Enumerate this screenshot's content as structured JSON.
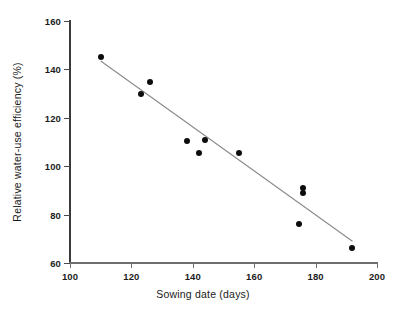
{
  "chart_data": {
    "type": "scatter",
    "title": "",
    "subtitle": "",
    "xlabel": "Sowing date (days)",
    "ylabel": "Relative water-use efficiency (%)",
    "xlim": [
      100,
      200
    ],
    "ylim": [
      60,
      160
    ],
    "xticks": [
      100,
      120,
      140,
      160,
      180,
      200
    ],
    "yticks": [
      60,
      80,
      100,
      120,
      140,
      160
    ],
    "xtick_labels": [
      "100",
      "120",
      "140",
      "160",
      "180",
      "200"
    ],
    "ytick_labels": [
      "60",
      "80",
      "100",
      "120",
      "140",
      "160"
    ],
    "grid": false,
    "legend": null,
    "legend_position": "none",
    "marker": "filled-circle",
    "marker_color": "#0d0d0d",
    "trendline_color": "#8a8a8a",
    "points": [
      {
        "x": 110,
        "y": 145
      },
      {
        "x": 123,
        "y": 130
      },
      {
        "x": 126,
        "y": 135
      },
      {
        "x": 138,
        "y": 110.5
      },
      {
        "x": 142,
        "y": 105.5
      },
      {
        "x": 144,
        "y": 111
      },
      {
        "x": 155,
        "y": 105.5
      },
      {
        "x": 176,
        "y": 91
      },
      {
        "x": 176,
        "y": 89
      },
      {
        "x": 174.5,
        "y": 76
      },
      {
        "x": 192,
        "y": 66
      }
    ],
    "trendline": {
      "x0": 110,
      "y0": 143.5,
      "x1": 192,
      "y1": 69
    }
  },
  "axis": {
    "x_title": "Sowing date (days)",
    "y_title": "Relative water-use efficiency (%)"
  }
}
